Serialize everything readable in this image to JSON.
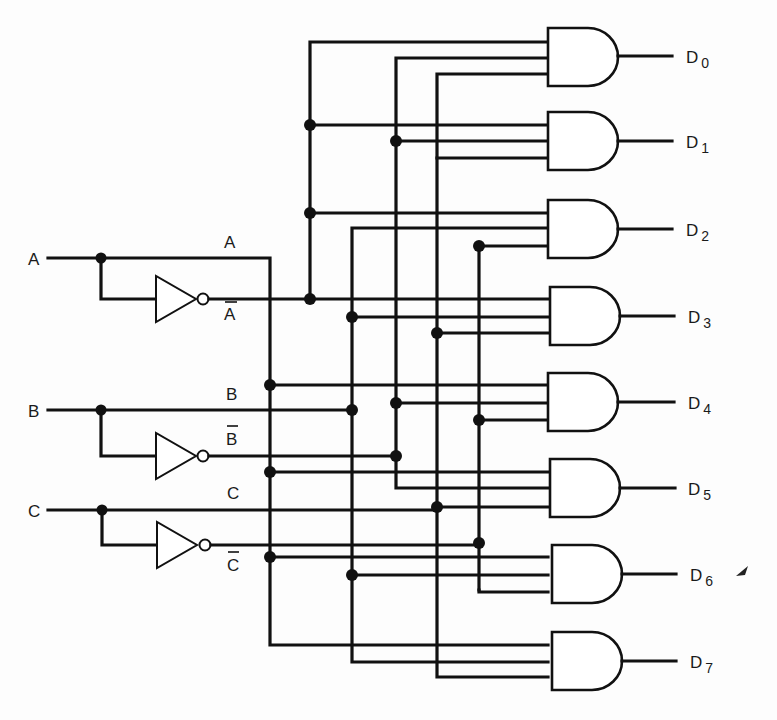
{
  "diagram": {
    "type": "3-to-8 line decoder logic circuit",
    "inputs": [
      {
        "id": "A",
        "label": "A",
        "y": 258
      },
      {
        "id": "B",
        "label": "B",
        "y": 410
      },
      {
        "id": "C",
        "label": "C",
        "y": 510
      }
    ],
    "bus_labels": {
      "A": "A",
      "A_bar": "A",
      "B": "B",
      "B_bar": "B",
      "C": "C",
      "C_bar": "C"
    },
    "inverters": [
      {
        "input": "A",
        "output": "A_bar"
      },
      {
        "input": "B",
        "output": "B_bar"
      },
      {
        "input": "C",
        "output": "C_bar"
      }
    ],
    "outputs": [
      {
        "name": "D",
        "sub": "0",
        "terms": [
          "A_bar",
          "B_bar",
          "C_bar"
        ]
      },
      {
        "name": "D",
        "sub": "1",
        "terms": [
          "A_bar",
          "B_bar",
          "C"
        ]
      },
      {
        "name": "D",
        "sub": "2",
        "terms": [
          "A_bar",
          "B",
          "C_bar"
        ]
      },
      {
        "name": "D",
        "sub": "3",
        "terms": [
          "A_bar",
          "B",
          "C"
        ]
      },
      {
        "name": "D",
        "sub": "4",
        "terms": [
          "A",
          "B_bar",
          "C_bar"
        ]
      },
      {
        "name": "D",
        "sub": "5",
        "terms": [
          "A",
          "B_bar",
          "C"
        ]
      },
      {
        "name": "D",
        "sub": "6",
        "terms": [
          "A",
          "B",
          "C_bar"
        ]
      },
      {
        "name": "D",
        "sub": "7",
        "terms": [
          "A",
          "B",
          "C"
        ]
      }
    ],
    "colors": {
      "ink": "#111111",
      "paper": "#fdfdfd"
    }
  }
}
